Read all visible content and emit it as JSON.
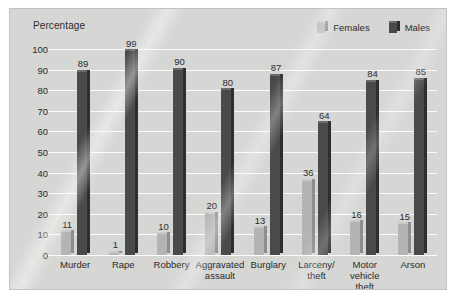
{
  "chart_data": {
    "type": "bar",
    "title": "",
    "xlabel": "",
    "ylabel": "Percentage",
    "ylim": [
      0,
      100
    ],
    "ytick_step": 10,
    "yticks": [
      "100",
      "90",
      "80",
      "70",
      "60",
      "50",
      "40",
      "30",
      "20",
      "10",
      "0"
    ],
    "grid": true,
    "legend_position": "top-right",
    "categories": [
      "Murder",
      "Rape",
      "Robbery",
      "Aggravated\nassault",
      "Burglary",
      "Larceny/\ntheft",
      "Motor\nvehicle theft",
      "Arson"
    ],
    "series": [
      {
        "name": "Females",
        "color": "#b4b4b2",
        "values": [
          11,
          1,
          10,
          20,
          13,
          36,
          16,
          15
        ]
      },
      {
        "name": "Males",
        "color": "#4a4a4a",
        "values": [
          89,
          99,
          90,
          80,
          87,
          64,
          84,
          85
        ]
      }
    ]
  },
  "legend": {
    "items": [
      {
        "label": "Females",
        "swatch_face": "#b4b4b2",
        "swatch_side": "#8e8e8c",
        "swatch_top": "#c9c9c7"
      },
      {
        "label": "Males",
        "swatch_face": "#4a4a4a",
        "swatch_side": "#2e2e2e",
        "swatch_top": "#6b6b6b"
      }
    ]
  },
  "colors": {
    "panel_background": "#d6d6d4",
    "page_background": "#ffffff",
    "gridline": "#fbfbfa",
    "text": "#2b2b2b",
    "females_face": "#b4b4b2",
    "females_side": "#8e8e8c",
    "females_top": "#c9c9c7",
    "males_face": "#4a4a4a",
    "males_side": "#2e2e2e",
    "males_top": "#6b6b6b"
  }
}
